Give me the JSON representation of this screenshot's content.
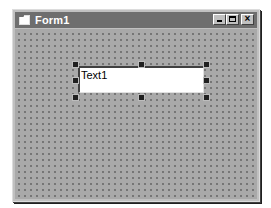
{
  "window": {
    "title": "Form1",
    "icon": "form-icon",
    "buttons": {
      "minimize": "minimize-icon",
      "maximize": "maximize-icon",
      "close": "close-icon",
      "close_glyph": "×"
    }
  },
  "form": {
    "grid": "dotted-design-grid",
    "controls": [
      {
        "type": "TextBox",
        "name": "Text1",
        "text": "Text1",
        "selected": true
      }
    ]
  },
  "colors": {
    "titlebar": "#6e6e6e",
    "form_background": "#a9a9a9",
    "textbox_background": "#ffffff"
  }
}
